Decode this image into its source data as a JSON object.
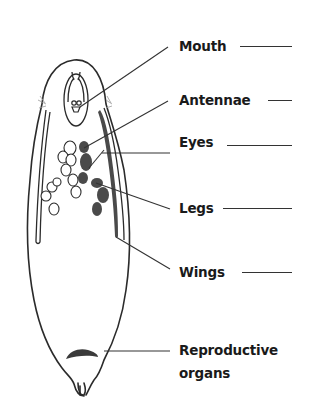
{
  "diagram": {
    "colors": {
      "outline": "#2b2b2b",
      "organ_fill": "#4a4a4a",
      "leader_line": "#333333",
      "text": "#1a1a1a",
      "background": "#ffffff"
    },
    "labels": [
      {
        "id": "mouth",
        "text": "Mouth"
      },
      {
        "id": "antennae",
        "text": "Antennae"
      },
      {
        "id": "eyes",
        "text": "Eyes"
      },
      {
        "id": "legs",
        "text": "Legs"
      },
      {
        "id": "wings",
        "text": "Wings"
      },
      {
        "id": "reproductive",
        "text": "Reproductive",
        "text_line2": "organs"
      }
    ]
  }
}
